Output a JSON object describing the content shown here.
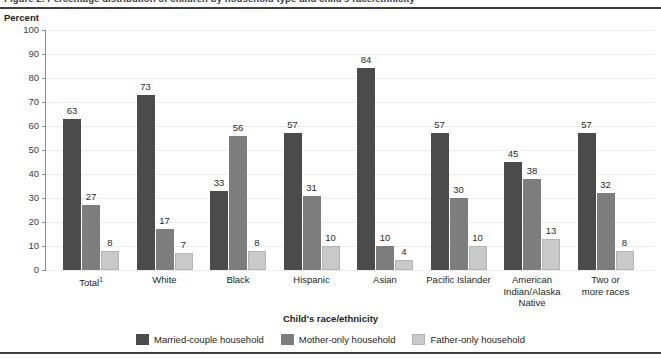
{
  "figure": {
    "title_cut": "Figure 2.  Percentage distribution of children by household type and child's race/ethnicity",
    "unit_label": "Percent"
  },
  "axis": {
    "x_title": "Child's race/ethnicity",
    "y_ticks": [
      "100",
      "90",
      "80",
      "70",
      "60",
      "50",
      "40",
      "30",
      "20",
      "10",
      "0"
    ]
  },
  "legend": {
    "items": [
      {
        "label": "Married-couple household",
        "color": "#4b4b4b"
      },
      {
        "label": "Mother-only household",
        "color": "#7d7d7d"
      },
      {
        "label": "Father-only household",
        "color": "#c9c9c9"
      }
    ]
  },
  "categories": [
    {
      "line1": "Total",
      "sup": "1",
      "line2": "",
      "line3": ""
    },
    {
      "line1": "White",
      "sup": "",
      "line2": "",
      "line3": ""
    },
    {
      "line1": "Black",
      "sup": "",
      "line2": "",
      "line3": ""
    },
    {
      "line1": "Hispanic",
      "sup": "",
      "line2": "",
      "line3": ""
    },
    {
      "line1": "Asian",
      "sup": "",
      "line2": "",
      "line3": ""
    },
    {
      "line1": "Pacific Islander",
      "sup": "",
      "line2": "",
      "line3": ""
    },
    {
      "line1": "American",
      "sup": "",
      "line2": "Indian/Alaska",
      "line3": "Native"
    },
    {
      "line1": "Two or",
      "sup": "",
      "line2": "more races",
      "line3": ""
    }
  ],
  "values": {
    "married": [
      "63",
      "73",
      "33",
      "57",
      "84",
      "57",
      "45",
      "57"
    ],
    "mother": [
      "27",
      "17",
      "56",
      "31",
      "10",
      "30",
      "38",
      "32"
    ],
    "father": [
      "8",
      "7",
      "8",
      "10",
      "4",
      "10",
      "13",
      "8"
    ]
  },
  "chart_data": {
    "type": "bar",
    "title": "Figure 2.  Percentage distribution of children by household type and child's race/ethnicity",
    "xlabel": "Child's race/ethnicity",
    "ylabel": "Percent",
    "ylim": [
      0,
      100
    ],
    "ytick_step": 10,
    "grid": true,
    "legend_position": "bottom",
    "categories": [
      "Total1",
      "White",
      "Black",
      "Hispanic",
      "Asian",
      "Pacific Islander",
      "American Indian/Alaska Native",
      "Two or more races"
    ],
    "series": [
      {
        "name": "Married-couple household",
        "color": "#4b4b4b",
        "values": [
          63,
          73,
          33,
          57,
          84,
          57,
          45,
          57
        ]
      },
      {
        "name": "Mother-only household",
        "color": "#7d7d7d",
        "values": [
          27,
          17,
          56,
          31,
          10,
          30,
          38,
          32
        ]
      },
      {
        "name": "Father-only household",
        "color": "#c9c9c9",
        "values": [
          8,
          7,
          8,
          10,
          4,
          10,
          13,
          8
        ]
      }
    ],
    "data_labels": true,
    "notes": [
      "1 Total includes all race/ethnicity categories shown."
    ]
  }
}
